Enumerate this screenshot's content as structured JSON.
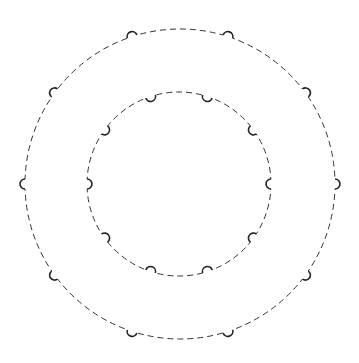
{
  "diagram": {
    "background": "#ffffff",
    "stroke_color": "#333333",
    "rings": [
      {
        "name": "outer-ring",
        "cx": 180,
        "cy": 184,
        "r": 155,
        "dash": "6 4",
        "notch_count": 10,
        "notch_start_deg": 0,
        "notch_direction": "outward",
        "notch_radius": 5
      },
      {
        "name": "inner-ring",
        "cx": 179,
        "cy": 184,
        "r": 92,
        "dash": "6 4",
        "notch_count": 10,
        "notch_start_deg": 0,
        "notch_direction": "inward",
        "notch_radius": 5
      }
    ]
  }
}
